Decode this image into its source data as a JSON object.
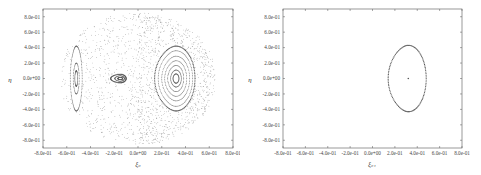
{
  "chart_data": [
    {
      "type": "scatter",
      "title": "",
      "xlabel": "ξ₀",
      "ylabel": "η",
      "xlim": [
        -0.8,
        0.8
      ],
      "ylim": [
        -0.9,
        0.9
      ],
      "xticks": [
        -0.8,
        -0.6,
        -0.4,
        -0.2,
        0.0,
        0.2,
        0.4,
        0.6,
        0.8
      ],
      "xtick_labels": [
        "-8.0e-01",
        "-6.0e-01",
        "-4.0e-01",
        "-2.0e-01",
        "0.0e+00",
        "2.0e-01",
        "4.0e-01",
        "6.0e-01",
        "8.0e-01"
      ],
      "yticks": [
        0.8,
        0.6,
        0.4,
        0.2,
        0.0,
        -0.2,
        -0.4,
        -0.6,
        -0.8
      ],
      "ytick_labels": [
        "8.0e-01",
        "6.0e-01",
        "4.0e-01",
        "2.0e-01",
        "0.0e+00",
        "-2.0e-01",
        "-4.0e-01",
        "-6.0e-01",
        "-8.0e-01"
      ],
      "grid": false,
      "legend": null,
      "description": "Poincaré section with multiple orbits: a large island centered near (0.32, 0.0) with nested closed curves (outer boundary from ξ≈0.14 to 0.48, η≈±0.42), a small island near (-0.15, 0.0), a thin elongated island near (-0.52, 0.0), surrounded by a chaotic sea extending to about ξ∈[-0.65, 0.65], η∈[-0.85, 0.85].",
      "series": [
        {
          "name": "main-island",
          "center": [
            0.32,
            0.0
          ],
          "rings": [
            {
              "rx_left": 0.18,
              "rx_right": 0.16,
              "ry": 0.42
            },
            {
              "rx_left": 0.15,
              "rx_right": 0.14,
              "ry": 0.36
            },
            {
              "rx_left": 0.12,
              "rx_right": 0.115,
              "ry": 0.29
            },
            {
              "rx_left": 0.095,
              "rx_right": 0.09,
              "ry": 0.23
            },
            {
              "rx_left": 0.07,
              "rx_right": 0.065,
              "ry": 0.17
            },
            {
              "rx_left": 0.045,
              "rx_right": 0.045,
              "ry": 0.11
            },
            {
              "rx_left": 0.025,
              "rx_right": 0.025,
              "ry": 0.06
            }
          ]
        },
        {
          "name": "small-island",
          "center": [
            -0.15,
            0.0
          ],
          "rings": [
            {
              "rx_left": 0.08,
              "rx_right": 0.05,
              "ry": 0.055
            },
            {
              "rx_left": 0.045,
              "rx_right": 0.035,
              "ry": 0.035
            },
            {
              "rx_left": 0.02,
              "rx_right": 0.02,
              "ry": 0.015
            }
          ]
        },
        {
          "name": "left-island",
          "center": [
            -0.52,
            0.0
          ],
          "rings": [
            {
              "rx_left": 0.05,
              "rx_right": 0.05,
              "ry": 0.42
            },
            {
              "rx_left": 0.025,
              "rx_right": 0.025,
              "ry": 0.2
            },
            {
              "rx_left": 0.012,
              "rx_right": 0.012,
              "ry": 0.1
            }
          ]
        },
        {
          "name": "chaotic-sea",
          "xrange": [
            -0.65,
            0.65
          ],
          "yrange": [
            -0.85,
            0.85
          ]
        }
      ]
    },
    {
      "type": "scatter",
      "title": "",
      "xlabel": "ξ₀₁",
      "ylabel": "η",
      "xlim": [
        -0.8,
        0.8
      ],
      "ylim": [
        -0.9,
        0.9
      ],
      "xticks": [
        -0.8,
        -0.6,
        -0.4,
        -0.2,
        0.0,
        0.2,
        0.4,
        0.6,
        0.8
      ],
      "xtick_labels": [
        "-8.0e-01",
        "-6.0e-01",
        "-4.0e-01",
        "-2.0e-01",
        "0.0e+00",
        "2.0e-01",
        "4.0e-01",
        "6.0e-01",
        "8.0e-01"
      ],
      "yticks": [
        0.8,
        0.6,
        0.4,
        0.2,
        0.0,
        -0.2,
        -0.4,
        -0.6,
        -0.8
      ],
      "ytick_labels": [
        "8.0e-01",
        "6.0e-01",
        "4.0e-01",
        "2.0e-01",
        "0.0e+00",
        "-2.0e-01",
        "-4.0e-01",
        "-6.0e-01",
        "-8.0e-01"
      ],
      "grid": false,
      "legend": null,
      "description": "Single closed D-shaped orbit around fixed point (0.32, 0.0), extending ξ≈0.14 to 0.48, η≈±0.43, with a single dot at the center.",
      "series": [
        {
          "name": "single-orbit",
          "center": [
            0.32,
            0.0
          ],
          "rings": [
            {
              "rx_left": 0.18,
              "rx_right": 0.16,
              "ry": 0.43
            }
          ]
        },
        {
          "name": "fixed-point",
          "points": [
            [
              0.32,
              0.0
            ]
          ]
        }
      ]
    }
  ],
  "colors": {
    "points": "#555555",
    "frame": "#555555",
    "text": "#444444"
  }
}
